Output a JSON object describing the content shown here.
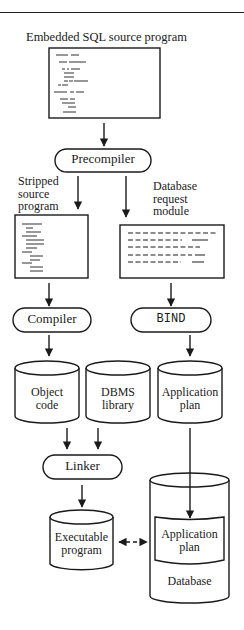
{
  "title": "Embedded SQL source program",
  "nodes": {
    "source_program": {
      "label": "Embedded SQL source program"
    },
    "precompiler": {
      "label": "Precompiler"
    },
    "stripped_source": {
      "label_lines": [
        "Stripped",
        "source",
        "program"
      ]
    },
    "request_module": {
      "label_lines": [
        "Database",
        "request",
        "module"
      ]
    },
    "compiler": {
      "label": "Compiler"
    },
    "bind": {
      "label": "BIND"
    },
    "object_code": {
      "label_lines": [
        "Object",
        "code"
      ]
    },
    "dbms_library": {
      "label_lines": [
        "DBMS",
        "library"
      ]
    },
    "application_plan": {
      "label_lines": [
        "Application",
        "plan"
      ]
    },
    "linker": {
      "label": "Linker"
    },
    "executable": {
      "label_lines": [
        "Executable",
        "program"
      ]
    },
    "database": {
      "label": "Database",
      "inner_label_lines": [
        "Application",
        "plan"
      ]
    }
  },
  "colors": {
    "line": "#1a1a1a",
    "background": "#ffffff"
  }
}
